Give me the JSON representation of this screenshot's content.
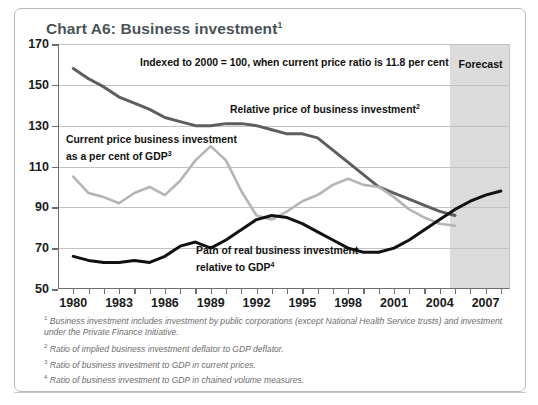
{
  "title": {
    "text": "Chart A6: Business investment",
    "superscript": "1"
  },
  "forecast": {
    "label": "Forecast",
    "start_year": 2004.7
  },
  "annotations": {
    "indexed_note": "Indexed to 2000 = 100, when current price ratio is 11.8 per cent",
    "relative_price": "Relative price of business investment",
    "relative_price_sup": "2",
    "current_price_line1": "Current price business investment",
    "current_price_line2": "as a per cent of GDP",
    "current_price_sup": "3",
    "real_path_line1": "Path of real business investment",
    "real_path_line2": "relative to GDP",
    "real_path_sup": "4"
  },
  "footnotes": [
    {
      "marker": "1",
      "text": "Business investment includes investment by public corporations (except National Health Service trusts) and investment under the Private Finance Initiative."
    },
    {
      "marker": "2",
      "text": "Ratio of implied business investment deflator to GDP deflator."
    },
    {
      "marker": "3",
      "text": "Ratio of business investment to GDP in current prices."
    },
    {
      "marker": "4",
      "text": "Ratio of business investment to GDP in chained volume measures."
    }
  ],
  "colors": {
    "title": "#4a5358",
    "relative_price_line": "#5e5e5e",
    "current_price_line": "#b5b5b5",
    "real_path_line": "#111111",
    "forecast_band": "#dcdcdc",
    "gridline": "#c2c2c2",
    "axis": "#6e6e6e"
  },
  "chart_data": {
    "type": "line",
    "title": "Chart A6: Business investment",
    "xlabel": "",
    "ylabel": "",
    "xlim": [
      1979,
      2008.6
    ],
    "ylim": [
      50,
      170
    ],
    "yticks": [
      50,
      70,
      90,
      110,
      130,
      150,
      170
    ],
    "xticks": [
      1980,
      1983,
      1986,
      1989,
      1992,
      1995,
      1998,
      2001,
      2004,
      2007
    ],
    "xtick_labels": [
      "1980",
      "1983",
      "1986",
      "1989",
      "1992",
      "1995",
      "1998",
      "2001",
      "2004",
      "2007"
    ],
    "grid": true,
    "legend": "annotations-inline",
    "note": "Indexed to 2000 = 100, when current price ratio is 11.8 per cent",
    "series": [
      {
        "name": "Relative price of business investment",
        "color": "#5e5e5e",
        "x": [
          1980,
          1981,
          1982,
          1983,
          1984,
          1985,
          1986,
          1987,
          1988,
          1989,
          1990,
          1991,
          1992,
          1993,
          1994,
          1995,
          1996,
          1997,
          1998,
          1999,
          2000,
          2001,
          2002,
          2003,
          2004,
          2005
        ],
        "values": [
          158,
          153,
          149,
          144,
          141,
          138,
          134,
          132,
          130,
          130,
          131,
          131,
          130,
          128,
          126,
          126,
          124,
          118,
          112,
          106,
          100,
          97,
          94,
          91,
          88,
          86
        ]
      },
      {
        "name": "Current price business investment as a per cent of GDP",
        "color": "#b5b5b5",
        "x": [
          1980,
          1981,
          1982,
          1983,
          1984,
          1985,
          1986,
          1987,
          1988,
          1989,
          1990,
          1991,
          1992,
          1993,
          1994,
          1995,
          1996,
          1997,
          1998,
          1999,
          2000,
          2001,
          2002,
          2003,
          2004,
          2005
        ],
        "values": [
          105,
          97,
          95,
          92,
          97,
          100,
          96,
          103,
          113,
          120,
          113,
          98,
          86,
          84,
          88,
          93,
          96,
          101,
          104,
          101,
          100,
          95,
          89,
          85,
          82,
          81
        ]
      },
      {
        "name": "Path of real business investment relative to GDP",
        "color": "#111111",
        "x": [
          1980,
          1981,
          1982,
          1983,
          1984,
          1985,
          1986,
          1987,
          1988,
          1989,
          1990,
          1991,
          1992,
          1993,
          1994,
          1995,
          1996,
          1997,
          1998,
          1999,
          2000,
          2001,
          2002,
          2003,
          2004,
          2005,
          2006,
          2007,
          2008
        ],
        "values": [
          66,
          64,
          63,
          63,
          64,
          63,
          66,
          71,
          73,
          70,
          74,
          79,
          84,
          86,
          85,
          82,
          78,
          74,
          70,
          68,
          68,
          70,
          74,
          79,
          84,
          89,
          93,
          96,
          98
        ]
      }
    ]
  }
}
